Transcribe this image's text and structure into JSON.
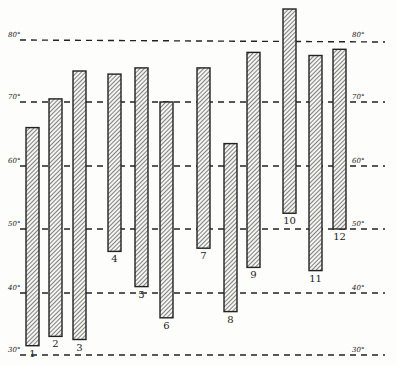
{
  "chart_data": {
    "type": "bar",
    "subtype": "floating-range",
    "title": "",
    "xlabel": "",
    "ylabel": "",
    "unit": "°",
    "ylim": [
      30,
      86
    ],
    "grid": true,
    "grid_values": [
      30,
      40,
      50,
      60,
      70,
      80
    ],
    "left_tick_labels": [
      "80°",
      "70°",
      "60°",
      "50°",
      "40°",
      "30°"
    ],
    "right_tick_labels": [
      "80°",
      "70°",
      "60°",
      "50°",
      "40°",
      "30°"
    ],
    "legend": null,
    "categories": [
      "1",
      "2",
      "3",
      "4",
      "5",
      "6",
      "7",
      "8",
      "9",
      "10",
      "11",
      "12"
    ],
    "series": [
      {
        "name": "high",
        "values": [
          66,
          70.5,
          75,
          74.5,
          75.5,
          70,
          75.5,
          63.5,
          78,
          85,
          77.5,
          78.5
        ]
      },
      {
        "name": "low",
        "values": [
          31.5,
          33,
          32.5,
          46.5,
          41,
          36,
          47,
          37,
          44,
          52.5,
          43.5,
          50
        ]
      }
    ]
  },
  "layout": {
    "width": 397,
    "height": 365,
    "plot_left": 28,
    "plot_right": 362,
    "y_px": {
      "80": 40,
      "70": 102,
      "60": 166,
      "50": 229,
      "40": 293,
      "30": 355
    },
    "bar_x": [
      26,
      49,
      73,
      108,
      135,
      160,
      197,
      224,
      247,
      283,
      309,
      333
    ],
    "bar_width": 13,
    "label_below": [
      true,
      true,
      true,
      true,
      true,
      true,
      true,
      true,
      true,
      true,
      true,
      true
    ]
  },
  "colors": {
    "ink": "#222222",
    "paper": "#fdfdfb"
  }
}
